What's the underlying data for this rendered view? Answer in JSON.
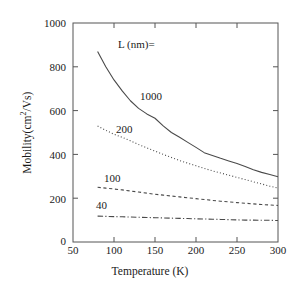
{
  "figure": {
    "background_color": "#ffffff",
    "line_color": "#4a4a4a",
    "axis_color": "#555555",
    "text_color": "#1a1a1a"
  },
  "axes": {
    "x_title": "Temperature (K)",
    "y_title_main": "Mobility(cm",
    "y_title_sup": "2",
    "y_title_tail": "/Vs)",
    "x_ticks": [
      "50",
      "100",
      "150",
      "200",
      "250",
      "300"
    ],
    "y_ticks": [
      "0",
      "200",
      "400",
      "600",
      "800",
      "1000"
    ]
  },
  "legend": {
    "header": "L (nm)=",
    "labels": {
      "l1000": "1000",
      "l200": "200",
      "l100": "100",
      "l40": "40"
    }
  },
  "chart_data": {
    "type": "line",
    "title": "",
    "xlabel": "Temperature (K)",
    "ylabel": "Mobility(cm^2/Vs)",
    "xlim": [
      50,
      300
    ],
    "ylim": [
      0,
      1000
    ],
    "xticks": [
      50,
      100,
      150,
      200,
      250,
      300
    ],
    "yticks": [
      0,
      200,
      400,
      600,
      800,
      1000
    ],
    "grid": false,
    "legend_position": "inline-curve-labels",
    "legend_title": "L (nm)=",
    "series": [
      {
        "name": "1000",
        "label": "1000",
        "linestyle": "solid",
        "x": [
          80,
          90,
          100,
          110,
          120,
          130,
          140,
          150,
          160,
          170,
          180,
          190,
          200,
          210,
          220,
          230,
          240,
          250,
          260,
          270,
          280,
          290,
          300
        ],
        "y": [
          870,
          800,
          740,
          690,
          645,
          610,
          585,
          565,
          530,
          500,
          478,
          455,
          432,
          408,
          395,
          382,
          370,
          358,
          345,
          330,
          318,
          308,
          298
        ]
      },
      {
        "name": "200",
        "label": "200",
        "linestyle": "dotted",
        "x": [
          80,
          90,
          100,
          110,
          120,
          130,
          140,
          150,
          160,
          170,
          180,
          190,
          200,
          210,
          220,
          230,
          240,
          250,
          260,
          270,
          280,
          290,
          300
        ],
        "y": [
          530,
          510,
          492,
          478,
          462,
          445,
          430,
          415,
          400,
          386,
          372,
          360,
          348,
          336,
          325,
          315,
          305,
          295,
          285,
          275,
          265,
          255,
          246
        ]
      },
      {
        "name": "100",
        "label": "100",
        "linestyle": "dashed",
        "x": [
          80,
          90,
          100,
          110,
          120,
          130,
          140,
          150,
          160,
          170,
          180,
          190,
          200,
          210,
          220,
          230,
          240,
          250,
          260,
          270,
          280,
          290,
          300
        ],
        "y": [
          250,
          246,
          242,
          238,
          233,
          228,
          223,
          218,
          214,
          210,
          206,
          202,
          198,
          194,
          190,
          186,
          183,
          180,
          177,
          174,
          171,
          169,
          167
        ]
      },
      {
        "name": "40",
        "label": "40",
        "linestyle": "dashdot",
        "x": [
          80,
          90,
          100,
          110,
          120,
          130,
          140,
          150,
          160,
          170,
          180,
          190,
          200,
          210,
          220,
          230,
          240,
          250,
          260,
          270,
          280,
          290,
          300
        ],
        "y": [
          118,
          117,
          116,
          115,
          114,
          113,
          112,
          111,
          110,
          109,
          108,
          107,
          106,
          105,
          104,
          103,
          102,
          101,
          100,
          100,
          99,
          99,
          98
        ]
      }
    ]
  }
}
